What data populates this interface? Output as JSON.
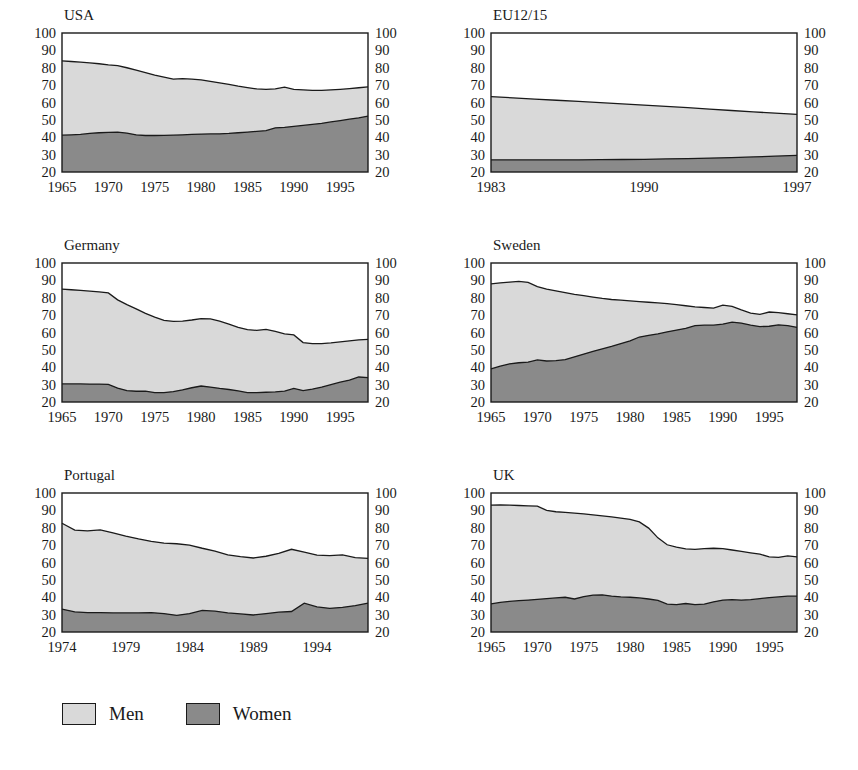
{
  "figure": {
    "legend": {
      "position": "bottom-left",
      "entries": [
        {
          "label": "Men",
          "color": "#d9d9d9",
          "name": "men"
        },
        {
          "label": "Women",
          "color": "#8a8a8a",
          "name": "women"
        }
      ]
    },
    "colors": {
      "men_fill": "#d9d9d9",
      "women_fill": "#8a8a8a",
      "line": "#1a1a1a",
      "background": "#ffffff"
    }
  },
  "chart_data": [
    {
      "type": "area",
      "title": "USA",
      "xlabel": "",
      "ylabel": "",
      "ylim": [
        20,
        100
      ],
      "yticks": [
        20,
        30,
        40,
        50,
        60,
        70,
        80,
        90,
        100
      ],
      "xlim": [
        1965,
        1998
      ],
      "xticks": [
        1965,
        1970,
        1975,
        1980,
        1985,
        1990,
        1995
      ],
      "grid": false,
      "stacked": false,
      "x": [
        1965,
        1966,
        1967,
        1968,
        1969,
        1970,
        1971,
        1972,
        1973,
        1974,
        1975,
        1976,
        1977,
        1978,
        1979,
        1980,
        1981,
        1982,
        1983,
        1984,
        1985,
        1986,
        1987,
        1988,
        1989,
        1990,
        1991,
        1992,
        1993,
        1994,
        1995,
        1996,
        1997,
        1998
      ],
      "series": [
        {
          "name": "Men",
          "values": [
            84.0,
            83.6,
            83.2,
            82.8,
            82.3,
            81.6,
            81.2,
            80.0,
            78.6,
            77.2,
            75.8,
            74.6,
            73.5,
            73.7,
            73.4,
            73.0,
            72.2,
            71.3,
            70.4,
            69.4,
            68.6,
            67.8,
            67.6,
            67.8,
            68.8,
            67.6,
            67.3,
            67.0,
            67.0,
            67.3,
            67.6,
            68.0,
            68.5,
            69.0
          ]
        },
        {
          "name": "Women",
          "values": [
            41.2,
            41.4,
            41.6,
            42.2,
            42.6,
            42.8,
            42.9,
            42.4,
            41.4,
            41.0,
            41.0,
            41.1,
            41.2,
            41.4,
            41.6,
            41.8,
            41.9,
            42.0,
            42.2,
            42.6,
            43.0,
            43.4,
            43.8,
            45.4,
            45.7,
            46.2,
            46.8,
            47.4,
            48.0,
            48.8,
            49.6,
            50.4,
            51.2,
            52.2
          ]
        }
      ]
    },
    {
      "type": "area",
      "title": "EU12/15",
      "xlabel": "",
      "ylabel": "",
      "ylim": [
        20,
        100
      ],
      "yticks": [
        20,
        30,
        40,
        50,
        60,
        70,
        80,
        90,
        100
      ],
      "xlim": [
        1983,
        1997
      ],
      "xticks": [
        1983,
        1990,
        1997
      ],
      "grid": false,
      "stacked": false,
      "x": [
        1983,
        1984,
        1985,
        1986,
        1987,
        1988,
        1989,
        1990,
        1991,
        1992,
        1993,
        1994,
        1995,
        1996,
        1997
      ],
      "series": [
        {
          "name": "Men",
          "values": [
            63.4,
            62.7,
            62.0,
            61.3,
            60.6,
            59.9,
            59.2,
            58.5,
            57.8,
            57.0,
            56.2,
            55.4,
            54.6,
            53.9,
            53.2
          ]
        },
        {
          "name": "Women",
          "values": [
            27.0,
            27.0,
            27.0,
            27.0,
            27.0,
            27.1,
            27.2,
            27.3,
            27.5,
            27.7,
            28.0,
            28.3,
            28.7,
            29.1,
            29.6
          ]
        }
      ]
    },
    {
      "type": "area",
      "title": "Germany",
      "xlabel": "",
      "ylabel": "",
      "ylim": [
        20,
        100
      ],
      "yticks": [
        20,
        30,
        40,
        50,
        60,
        70,
        80,
        90,
        100
      ],
      "xlim": [
        1965,
        1998
      ],
      "xticks": [
        1965,
        1970,
        1975,
        1980,
        1985,
        1990,
        1995
      ],
      "grid": false,
      "stacked": false,
      "x": [
        1965,
        1966,
        1967,
        1968,
        1969,
        1970,
        1971,
        1972,
        1973,
        1974,
        1975,
        1976,
        1977,
        1978,
        1979,
        1980,
        1981,
        1982,
        1983,
        1984,
        1985,
        1986,
        1987,
        1988,
        1989,
        1990,
        1991,
        1992,
        1993,
        1994,
        1995,
        1996,
        1997,
        1998
      ],
      "series": [
        {
          "name": "Men",
          "values": [
            85.0,
            84.6,
            84.2,
            83.8,
            83.4,
            82.8,
            78.8,
            76.0,
            73.6,
            71.0,
            68.8,
            67.0,
            66.4,
            66.6,
            67.2,
            68.0,
            67.8,
            66.6,
            64.8,
            63.0,
            61.6,
            61.2,
            61.8,
            60.6,
            59.2,
            58.6,
            54.2,
            53.6,
            53.6,
            54.0,
            54.6,
            55.2,
            55.8,
            56.0
          ]
        },
        {
          "name": "Women",
          "values": [
            30.4,
            30.4,
            30.4,
            30.3,
            30.3,
            30.2,
            28.0,
            26.6,
            26.2,
            26.2,
            25.4,
            25.4,
            26.0,
            27.0,
            28.2,
            29.2,
            28.6,
            27.8,
            27.2,
            26.4,
            25.4,
            25.4,
            25.6,
            25.8,
            26.2,
            27.8,
            26.6,
            27.4,
            28.6,
            30.0,
            31.4,
            32.6,
            34.4,
            34.0
          ]
        }
      ]
    },
    {
      "type": "area",
      "title": "Sweden",
      "xlabel": "",
      "ylabel": "",
      "ylim": [
        20,
        100
      ],
      "yticks": [
        20,
        30,
        40,
        50,
        60,
        70,
        80,
        90,
        100
      ],
      "xlim": [
        1965,
        1998
      ],
      "xticks": [
        1965,
        1970,
        1975,
        1980,
        1985,
        1990,
        1995
      ],
      "grid": false,
      "stacked": false,
      "x": [
        1965,
        1966,
        1967,
        1968,
        1969,
        1970,
        1971,
        1972,
        1973,
        1974,
        1975,
        1976,
        1977,
        1978,
        1979,
        1980,
        1981,
        1982,
        1983,
        1984,
        1985,
        1986,
        1987,
        1988,
        1989,
        1990,
        1991,
        1992,
        1993,
        1994,
        1995,
        1996,
        1997,
        1998
      ],
      "series": [
        {
          "name": "Men",
          "values": [
            88.0,
            88.6,
            89.0,
            89.4,
            88.8,
            86.4,
            85.0,
            84.0,
            83.0,
            82.0,
            81.2,
            80.4,
            79.6,
            79.0,
            78.6,
            78.2,
            77.8,
            77.4,
            77.0,
            76.6,
            76.0,
            75.4,
            74.8,
            74.4,
            74.0,
            75.8,
            75.0,
            73.0,
            71.2,
            70.4,
            71.8,
            71.4,
            70.8,
            70.2
          ]
        },
        {
          "name": "Women",
          "values": [
            39.0,
            40.6,
            42.0,
            42.6,
            43.0,
            44.2,
            43.6,
            43.8,
            44.4,
            46.0,
            47.6,
            49.2,
            50.6,
            52.0,
            53.6,
            55.2,
            57.4,
            58.4,
            59.2,
            60.4,
            61.4,
            62.4,
            64.0,
            64.2,
            64.2,
            64.8,
            66.0,
            65.4,
            64.2,
            63.4,
            63.6,
            64.4,
            64.0,
            63.0
          ]
        }
      ]
    },
    {
      "type": "area",
      "title": "Portugal",
      "xlabel": "",
      "ylabel": "",
      "ylim": [
        20,
        100
      ],
      "yticks": [
        20,
        30,
        40,
        50,
        60,
        70,
        80,
        90,
        100
      ],
      "xlim": [
        1974,
        1998
      ],
      "xticks": [
        1974,
        1979,
        1984,
        1989,
        1994
      ],
      "grid": false,
      "stacked": false,
      "x": [
        1974,
        1975,
        1976,
        1977,
        1978,
        1979,
        1980,
        1981,
        1982,
        1983,
        1984,
        1985,
        1986,
        1987,
        1988,
        1989,
        1990,
        1991,
        1992,
        1993,
        1994,
        1995,
        1996,
        1997,
        1998
      ],
      "series": [
        {
          "name": "Men",
          "values": [
            82.6,
            78.6,
            78.2,
            78.8,
            77.0,
            75.2,
            73.6,
            72.2,
            71.2,
            70.8,
            70.0,
            68.2,
            66.6,
            64.4,
            63.4,
            62.6,
            63.6,
            65.2,
            67.6,
            66.0,
            64.2,
            64.0,
            64.4,
            62.8,
            62.4,
            66.6
          ]
        },
        {
          "name": "Women",
          "values": [
            33.2,
            31.6,
            31.2,
            31.2,
            31.0,
            31.0,
            31.0,
            31.2,
            30.6,
            29.6,
            30.6,
            32.4,
            32.0,
            31.0,
            30.4,
            29.8,
            30.6,
            31.4,
            31.8,
            36.6,
            34.4,
            33.6,
            34.2,
            35.2,
            36.6,
            40.4
          ]
        }
      ]
    },
    {
      "type": "area",
      "title": "UK",
      "xlabel": "",
      "ylabel": "",
      "ylim": [
        20,
        100
      ],
      "yticks": [
        20,
        30,
        40,
        50,
        60,
        70,
        80,
        90,
        100
      ],
      "xlim": [
        1965,
        1998
      ],
      "xticks": [
        1965,
        1970,
        1975,
        1980,
        1985,
        1990,
        1995
      ],
      "grid": false,
      "stacked": false,
      "x": [
        1965,
        1966,
        1967,
        1968,
        1969,
        1970,
        1971,
        1972,
        1973,
        1974,
        1975,
        1976,
        1977,
        1978,
        1979,
        1980,
        1981,
        1982,
        1983,
        1984,
        1985,
        1986,
        1987,
        1988,
        1989,
        1990,
        1991,
        1992,
        1993,
        1994,
        1995,
        1996,
        1997,
        1998
      ],
      "series": [
        {
          "name": "Men",
          "values": [
            93.0,
            93.2,
            93.0,
            92.8,
            92.6,
            92.4,
            90.0,
            89.2,
            88.8,
            88.4,
            88.0,
            87.4,
            86.8,
            86.2,
            85.6,
            84.8,
            83.4,
            79.8,
            74.2,
            70.2,
            68.8,
            67.8,
            67.6,
            68.0,
            68.2,
            68.0,
            67.2,
            66.4,
            65.6,
            64.8,
            63.2,
            63.0,
            63.8,
            63.2
          ]
        },
        {
          "name": "Women",
          "values": [
            36.2,
            37.0,
            37.6,
            38.0,
            38.4,
            38.8,
            39.2,
            39.6,
            40.0,
            39.0,
            40.4,
            41.2,
            41.4,
            40.6,
            40.2,
            40.0,
            39.6,
            39.0,
            38.2,
            36.0,
            35.8,
            36.4,
            35.8,
            36.0,
            37.4,
            38.4,
            38.6,
            38.4,
            38.6,
            39.2,
            39.8,
            40.2,
            40.6,
            40.6
          ]
        }
      ]
    }
  ]
}
